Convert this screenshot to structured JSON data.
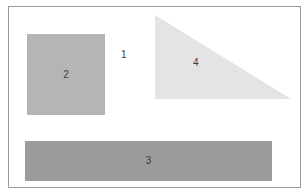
{
  "diagram": {
    "shapes": [
      {
        "id": "1",
        "type": "text-only",
        "label": "1"
      },
      {
        "id": "2",
        "type": "square",
        "label": "2",
        "color": "#b5b5b5"
      },
      {
        "id": "3",
        "type": "rectangle-bar",
        "label": "3",
        "color": "#9b9b9b"
      },
      {
        "id": "4",
        "type": "right-triangle",
        "label": "4",
        "color": "#e4e4e4"
      }
    ],
    "frame": {
      "border_color": "#9a9a9a",
      "background": "#ffffff"
    }
  }
}
